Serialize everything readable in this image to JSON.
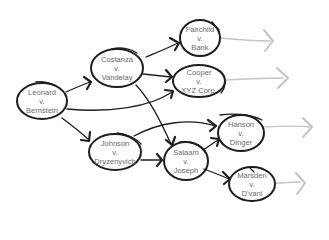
{
  "diagram": {
    "type": "case-citation-flow",
    "colors": {
      "ink": "#1e1e1e",
      "text": "#6a6a6a",
      "faded_arrow": "#c4c4c4",
      "background": "#ffffff"
    },
    "nodes": [
      {
        "id": "leonard",
        "line1": "Leonard",
        "line2": "v.",
        "line3": "Bernstein",
        "cx": 42,
        "cy": 101,
        "rx": 25,
        "ry": 18
      },
      {
        "id": "costanza",
        "line1": "Costanza",
        "line2": "v.",
        "line3": "Vandelay",
        "cx": 117,
        "cy": 68,
        "rx": 26,
        "ry": 19
      },
      {
        "id": "fairchild",
        "line1": "Fairchild",
        "line2": "v.",
        "line3": "Bank",
        "cx": 200,
        "cy": 38,
        "rx": 20,
        "ry": 18
      },
      {
        "id": "cooper",
        "line1": "Cooper",
        "line2": "v.",
        "line3": "XYZ Corp.",
        "cx": 199,
        "cy": 81,
        "rx": 26,
        "ry": 16
      },
      {
        "id": "johnson",
        "line1": "Johnson",
        "line2": "v.",
        "line3": "Dryzenyvich",
        "cx": 115,
        "cy": 152,
        "rx": 26,
        "ry": 18
      },
      {
        "id": "salaam",
        "line1": "Salaam",
        "line2": "v.",
        "line3": "Joseph",
        "cx": 186,
        "cy": 161,
        "rx": 22,
        "ry": 19
      },
      {
        "id": "hanson",
        "line1": "Hanson",
        "line2": "v.",
        "line3": "Dinger",
        "cx": 241,
        "cy": 133,
        "rx": 23,
        "ry": 18
      },
      {
        "id": "marsden",
        "line1": "Marsden",
        "line2": "v.",
        "line3": "D'vani",
        "cx": 252,
        "cy": 184,
        "rx": 23,
        "ry": 17
      }
    ],
    "edges": [
      {
        "from": "leonard",
        "to": "costanza"
      },
      {
        "from": "leonard",
        "to": "cooper"
      },
      {
        "from": "leonard",
        "to": "johnson"
      },
      {
        "from": "costanza",
        "to": "fairchild"
      },
      {
        "from": "costanza",
        "to": "cooper"
      },
      {
        "from": "costanza",
        "to": "salaam"
      },
      {
        "from": "johnson",
        "to": "salaam"
      },
      {
        "from": "johnson",
        "to": "hanson"
      },
      {
        "from": "salaam",
        "to": "hanson"
      },
      {
        "from": "salaam",
        "to": "marsden"
      }
    ],
    "outgoing_faded_arrows": [
      {
        "from": "fairchild"
      },
      {
        "from": "cooper"
      },
      {
        "from": "hanson"
      },
      {
        "from": "marsden"
      }
    ]
  }
}
